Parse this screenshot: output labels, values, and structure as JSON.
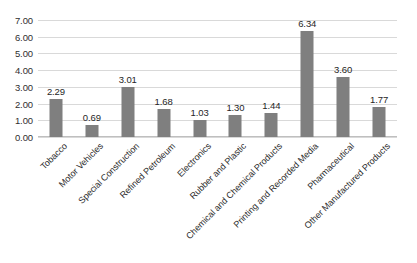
{
  "chart_data": {
    "type": "bar",
    "title": "",
    "subtitle": "",
    "xlabel": "",
    "ylabel": "",
    "categories": [
      "Tobacco",
      "Motor Vehicles",
      "Special Construction",
      "Refined Petroleum",
      "Electronics",
      "Rubber and Plastic",
      "Chemical and Chemical Products",
      "Printing and Recorded Media",
      "Pharmaceutical",
      "Other Manufactured Products"
    ],
    "values": [
      2.29,
      0.69,
      3.01,
      1.68,
      1.03,
      1.3,
      1.44,
      6.34,
      3.6,
      1.77
    ],
    "data_labels": [
      "2.29",
      "0.69",
      "3.01",
      "1.68",
      "1.03",
      "1.30",
      "1.44",
      "6.34",
      "3.60",
      "1.77"
    ],
    "ylim": [
      0,
      7
    ],
    "ytick_values": [
      0,
      1,
      2,
      3,
      4,
      5,
      6,
      7
    ],
    "ytick_labels": [
      "0.00",
      "1.00",
      "2.00",
      "3.00",
      "4.00",
      "5.00",
      "6.00",
      "7.00"
    ],
    "grid": true,
    "legend": "none",
    "legend_position": "none",
    "bar_color": "#7f7f7f",
    "gridline_color": "#d9d9d9",
    "axis_color": "#bfbfbf",
    "text_color": "#2b2b2b",
    "background_color": "#ffffff",
    "x_label_rotation_deg": -45
  }
}
